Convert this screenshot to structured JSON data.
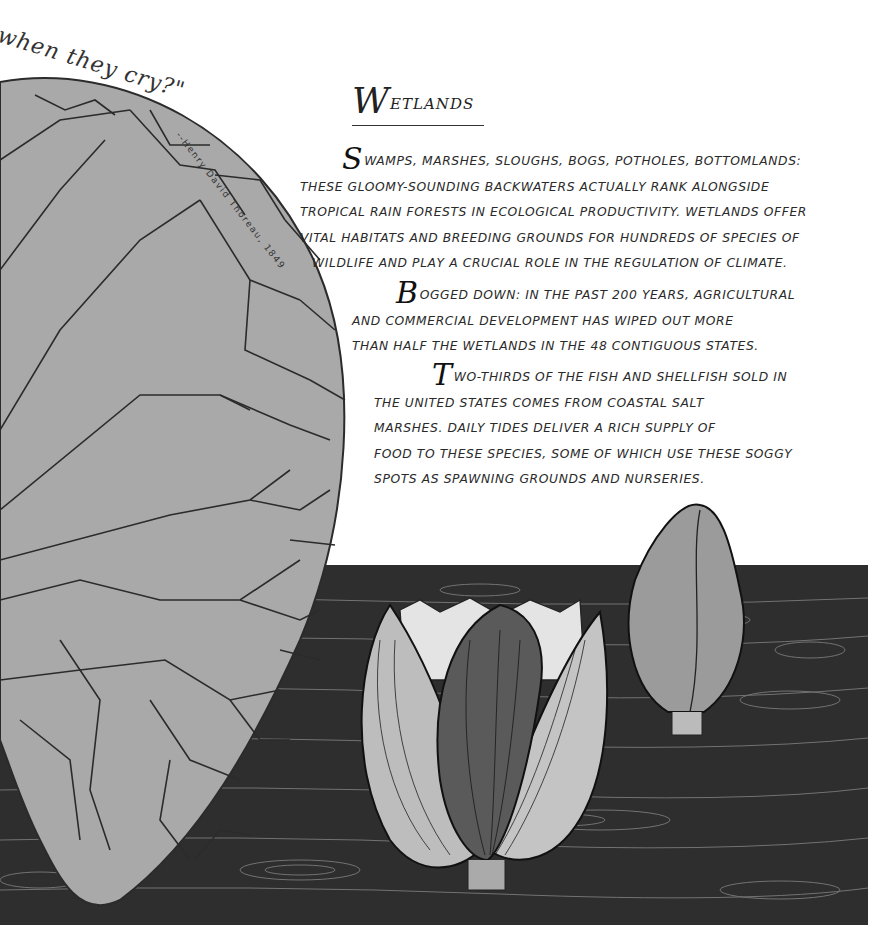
{
  "quote": {
    "fragment": "when they cry?\"",
    "attribution": "--Henry David Thoreau, 1849"
  },
  "title": {
    "initial": "W",
    "rest": "etlands"
  },
  "paragraphs": [
    {
      "initial": "S",
      "lines": [
        "wamps, marshes, sloughs, bogs, potholes, bottomlands:",
        "these gloomy-sounding backwaters actually rank alongside",
        "tropical rain forests in ecological productivity. Wetlands offer",
        "vital habitats and breeding grounds for hundreds of species of",
        "wildlife and play a crucial role in the regulation of climate."
      ]
    },
    {
      "initial": "B",
      "lines": [
        "ogged down: In the past 200 years, agricultural",
        "and commercial development has wiped out more",
        "than half the wetlands in the 48 contiguous states."
      ]
    },
    {
      "initial": "T",
      "lines": [
        "wo-thirds of the fish and shellfish sold in",
        "the United States comes from coastal salt",
        "marshes. Daily tides deliver a rich supply of",
        "food to these species, some of which use these soggy",
        "spots as spawning grounds and nurseries."
      ]
    }
  ],
  "illustration": {
    "elements": [
      "lily-pad-leaf",
      "dark-water",
      "lotus-flower",
      "lotus-bud"
    ],
    "colors": {
      "leaf": "#a9a9a9",
      "vein": "#2b2b2b",
      "water": "#2e2e2e",
      "ripple": "#8a8a8a",
      "bud": "#9b9b9b",
      "petal_light": "#bdbdbd"
    }
  }
}
